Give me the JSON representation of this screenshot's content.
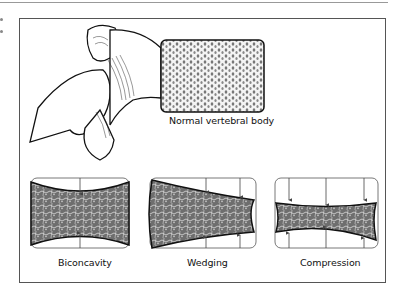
{
  "figure": {
    "labels": {
      "normal": "Normal vertebral body",
      "biconcavity": "Biconcavity",
      "wedging": "Wedging",
      "compression": "Compression"
    },
    "colors": {
      "stroke": "#111111",
      "frame": "#555555",
      "arrow": "#444444",
      "bone_fill": "#9a9a9a"
    }
  }
}
